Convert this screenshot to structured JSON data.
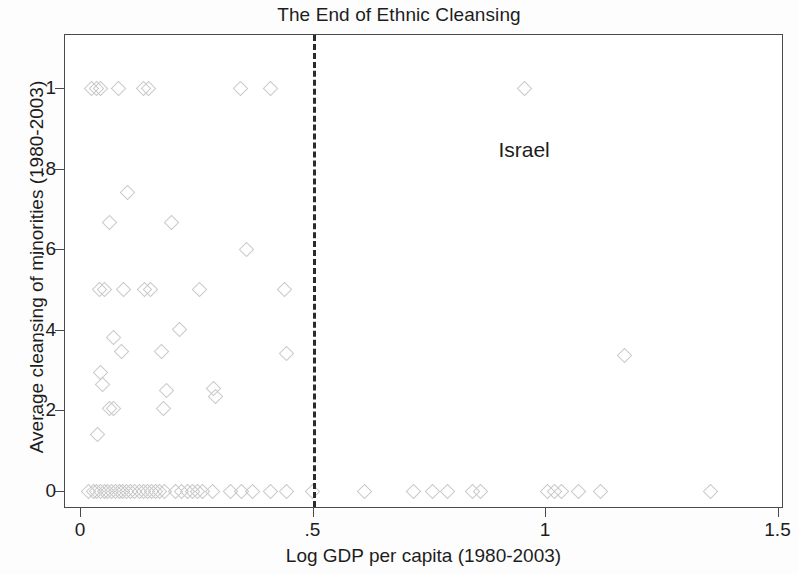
{
  "chart_data": {
    "type": "scatter",
    "title": "The End of Ethnic Cleansing",
    "xlabel": "Log GDP per capita (1980-2003)",
    "ylabel": "Average cleansing of minorities (1980-2003)",
    "xlim": [
      0,
      1.5
    ],
    "ylim": [
      -0.04,
      1.1
    ],
    "xticks": [
      0,
      0.5,
      1,
      1.5
    ],
    "xticklabels": [
      "0",
      ".5",
      "1",
      "1.5"
    ],
    "yticks": [
      0,
      0.2,
      0.4,
      0.6,
      0.8,
      1
    ],
    "yticklabels": [
      "0",
      ".2",
      ".4",
      ".6",
      ".8",
      "1"
    ],
    "grid": false,
    "legend": null,
    "marker": "diamond-open",
    "marker_color": "#c9c9c9",
    "frame_color": "#4a4a4a",
    "reference_lines": [
      {
        "orientation": "vertical",
        "value": 0.5,
        "style": "dashed",
        "color": "#2b2b2b"
      }
    ],
    "annotations": [
      {
        "text": "Israel",
        "x": 0.955,
        "y": 0.9,
        "point_x": 0.955,
        "point_y": 1.0
      }
    ],
    "points": [
      {
        "x": 0.025,
        "y": 1.0
      },
      {
        "x": 0.035,
        "y": 1.0
      },
      {
        "x": 0.045,
        "y": 1.0
      },
      {
        "x": 0.082,
        "y": 1.0
      },
      {
        "x": 0.137,
        "y": 1.0
      },
      {
        "x": 0.148,
        "y": 1.0
      },
      {
        "x": 0.345,
        "y": 1.0
      },
      {
        "x": 0.41,
        "y": 1.0
      },
      {
        "x": 0.955,
        "y": 1.0
      },
      {
        "x": 0.103,
        "y": 0.74
      },
      {
        "x": 0.064,
        "y": 0.667
      },
      {
        "x": 0.197,
        "y": 0.667
      },
      {
        "x": 0.358,
        "y": 0.6
      },
      {
        "x": 0.042,
        "y": 0.5
      },
      {
        "x": 0.052,
        "y": 0.5
      },
      {
        "x": 0.093,
        "y": 0.5
      },
      {
        "x": 0.138,
        "y": 0.5
      },
      {
        "x": 0.152,
        "y": 0.5
      },
      {
        "x": 0.258,
        "y": 0.5
      },
      {
        "x": 0.44,
        "y": 0.5
      },
      {
        "x": 0.215,
        "y": 0.4
      },
      {
        "x": 0.073,
        "y": 0.38
      },
      {
        "x": 0.09,
        "y": 0.345
      },
      {
        "x": 0.175,
        "y": 0.345
      },
      {
        "x": 0.445,
        "y": 0.34
      },
      {
        "x": 1.17,
        "y": 0.335
      },
      {
        "x": 0.044,
        "y": 0.295
      },
      {
        "x": 0.048,
        "y": 0.265
      },
      {
        "x": 0.186,
        "y": 0.25
      },
      {
        "x": 0.287,
        "y": 0.255
      },
      {
        "x": 0.292,
        "y": 0.235
      },
      {
        "x": 0.063,
        "y": 0.205
      },
      {
        "x": 0.072,
        "y": 0.205
      },
      {
        "x": 0.18,
        "y": 0.205
      },
      {
        "x": 0.038,
        "y": 0.14
      },
      {
        "x": 0.018,
        "y": 0.0
      },
      {
        "x": 0.028,
        "y": 0.0
      },
      {
        "x": 0.036,
        "y": 0.0
      },
      {
        "x": 0.044,
        "y": 0.0
      },
      {
        "x": 0.052,
        "y": 0.0
      },
      {
        "x": 0.06,
        "y": 0.0
      },
      {
        "x": 0.068,
        "y": 0.0
      },
      {
        "x": 0.076,
        "y": 0.0
      },
      {
        "x": 0.084,
        "y": 0.0
      },
      {
        "x": 0.092,
        "y": 0.0
      },
      {
        "x": 0.1,
        "y": 0.0
      },
      {
        "x": 0.108,
        "y": 0.0
      },
      {
        "x": 0.118,
        "y": 0.0
      },
      {
        "x": 0.127,
        "y": 0.0
      },
      {
        "x": 0.136,
        "y": 0.0
      },
      {
        "x": 0.145,
        "y": 0.0
      },
      {
        "x": 0.153,
        "y": 0.0
      },
      {
        "x": 0.162,
        "y": 0.0
      },
      {
        "x": 0.172,
        "y": 0.0
      },
      {
        "x": 0.181,
        "y": 0.0
      },
      {
        "x": 0.205,
        "y": 0.0
      },
      {
        "x": 0.218,
        "y": 0.0
      },
      {
        "x": 0.231,
        "y": 0.0
      },
      {
        "x": 0.243,
        "y": 0.0
      },
      {
        "x": 0.253,
        "y": 0.0
      },
      {
        "x": 0.263,
        "y": 0.0
      },
      {
        "x": 0.285,
        "y": 0.0
      },
      {
        "x": 0.323,
        "y": 0.0
      },
      {
        "x": 0.348,
        "y": 0.0
      },
      {
        "x": 0.372,
        "y": 0.0
      },
      {
        "x": 0.41,
        "y": 0.0
      },
      {
        "x": 0.445,
        "y": 0.0
      },
      {
        "x": 0.5,
        "y": 0.0
      },
      {
        "x": 0.612,
        "y": 0.0
      },
      {
        "x": 0.718,
        "y": 0.0
      },
      {
        "x": 0.757,
        "y": 0.0
      },
      {
        "x": 0.79,
        "y": 0.0
      },
      {
        "x": 0.845,
        "y": 0.0
      },
      {
        "x": 0.862,
        "y": 0.0
      },
      {
        "x": 1.005,
        "y": 0.0
      },
      {
        "x": 1.02,
        "y": 0.0
      },
      {
        "x": 1.035,
        "y": 0.0
      },
      {
        "x": 1.072,
        "y": 0.0
      },
      {
        "x": 1.12,
        "y": 0.0
      },
      {
        "x": 1.355,
        "y": 0.0
      }
    ]
  }
}
